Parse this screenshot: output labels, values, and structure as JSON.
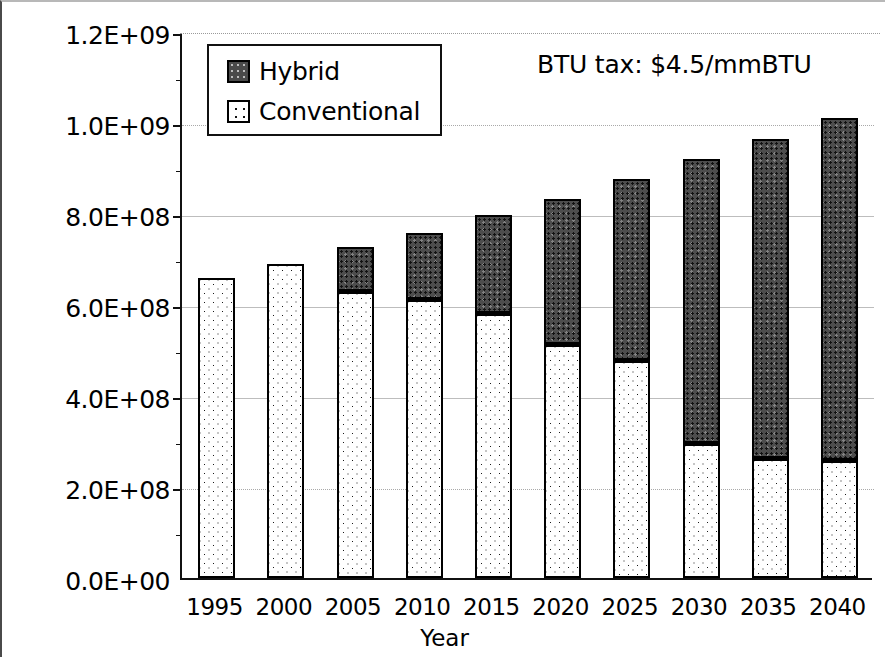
{
  "chart_data": {
    "type": "bar",
    "stacked": true,
    "title": "",
    "xlabel": "Year",
    "ylabel": "",
    "categories": [
      "1995",
      "2000",
      "2005",
      "2010",
      "2015",
      "2020",
      "2025",
      "2030",
      "2035",
      "2040"
    ],
    "series": [
      {
        "name": "Conventional",
        "values": [
          660000000,
          690000000,
          628000000,
          610000000,
          580000000,
          512000000,
          477000000,
          295000000,
          262000000,
          257000000
        ]
      },
      {
        "name": "Hybrid",
        "values": [
          0,
          0,
          100000000,
          148000000,
          218000000,
          321000000,
          400000000,
          626000000,
          703000000,
          754000000
        ]
      }
    ],
    "totals": [
      660000000,
      690000000,
      728000000,
      758000000,
      798000000,
      833000000,
      877000000,
      921000000,
      965000000,
      1011000000
    ],
    "ylim": [
      0,
      1200000000
    ],
    "ytick_values": [
      0,
      200000000,
      400000000,
      600000000,
      800000000,
      1000000000,
      1200000000
    ],
    "ytick_labels": [
      "0.0E+00",
      "2.0E+08",
      "4.0E+08",
      "6.0E+08",
      "8.0E+08",
      "1.0E+09",
      "1.2E+09"
    ],
    "grid": true,
    "legend_position": "top-left",
    "annotations": [
      "BTU tax:  $4.5/mmBTU"
    ]
  },
  "axes": {
    "x_title": "Year",
    "x_labels": [
      "1995",
      "2000",
      "2005",
      "2010",
      "2015",
      "2020",
      "2025",
      "2030",
      "2035",
      "2040"
    ],
    "y_labels": [
      "1.2E+09",
      "1.0E+09",
      "8.0E+08",
      "6.0E+08",
      "4.0E+08",
      "2.0E+08",
      "0.0E+00"
    ]
  },
  "legend": {
    "items": [
      {
        "label": "Hybrid",
        "swatch": "dark-dotted-swatch"
      },
      {
        "label": "Conventional",
        "swatch": "light-dotted-swatch"
      }
    ]
  },
  "annotation": {
    "text": "BTU tax:  $4.5/mmBTU"
  },
  "colors": {
    "hybrid": "#4d4d4d",
    "conventional": "#ffffff",
    "outline": "#000000",
    "grid": "#a9a9a9"
  }
}
